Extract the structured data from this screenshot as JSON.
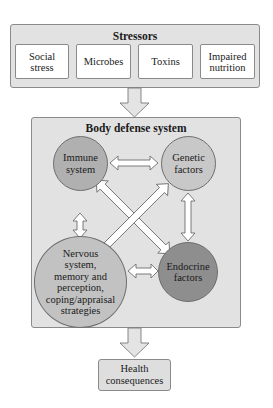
{
  "stressors": {
    "title": "Stressors",
    "items": [
      {
        "label": "Social\nstress"
      },
      {
        "label": "Microbes"
      },
      {
        "label": "Toxins"
      },
      {
        "label": "Impaired\nnutrition"
      }
    ]
  },
  "body_defense": {
    "title": "Body defense system",
    "nodes": {
      "immune": {
        "label": "Immune\nsystem",
        "color": "#b0b0b0"
      },
      "genetic": {
        "label": "Genetic\nfactors",
        "color": "#c8c8c8"
      },
      "nervous": {
        "label": "Nervous\nsystem,\nmemory and\nperception,\ncoping/appraisal\nstrategies",
        "color": "#c2c2c2"
      },
      "endocrine": {
        "label": "Endocrine\nfactors",
        "color": "#8e8e8e"
      }
    },
    "connections": [
      {
        "from": "immune",
        "to": "genetic",
        "type": "bidirectional"
      },
      {
        "from": "immune",
        "to": "nervous",
        "type": "bidirectional"
      },
      {
        "from": "genetic",
        "to": "endocrine",
        "type": "bidirectional"
      },
      {
        "from": "nervous",
        "to": "endocrine",
        "type": "bidirectional"
      },
      {
        "from": "immune",
        "to": "endocrine",
        "type": "bidirectional"
      },
      {
        "from": "genetic",
        "to": "nervous",
        "type": "bidirectional"
      }
    ]
  },
  "outcome": {
    "label": "Health\nconsequences"
  },
  "flow": [
    "Stressors",
    "Body defense system",
    "Health consequences"
  ]
}
